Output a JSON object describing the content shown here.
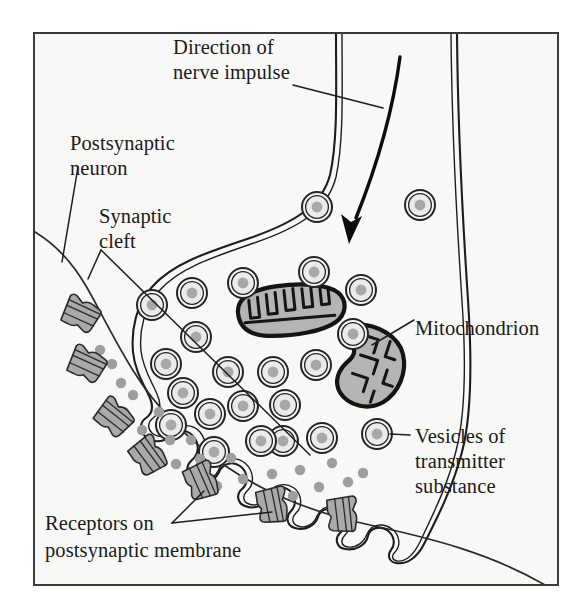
{
  "figure": {
    "background_color": "#ffffff",
    "panel_color": "#f8f8f6",
    "border_color": "#3a3a3a",
    "ink_color": "#1a1a1a",
    "organelle_fill": "#b4b4b4",
    "vesicle_core_color": "#a8a8a8",
    "transmitter_color": "#9e9e9e",
    "receptor_color": "#a9a9a9"
  },
  "labels": {
    "direction_line1": "Direction of",
    "direction_line2": "nerve impulse",
    "postsynaptic_line1": "Postsynaptic",
    "postsynaptic_line2": "neuron",
    "cleft_line1": "Synaptic",
    "cleft_line2": "cleft",
    "mitochondrion": "Mitochondrion",
    "vesicles_line1": "Vesicles of",
    "vesicles_line2": "transmitter",
    "vesicles_line3": "substance",
    "receptors_line1": "Receptors on",
    "receptors_line2": "postsynaptic membrane"
  },
  "structures": {
    "presynaptic_terminal": "presynaptic axon terminal",
    "postsynaptic_neuron": "postsynaptic neuron membrane",
    "synaptic_cleft": "synaptic cleft",
    "impulse_arrow": "direction of nerve impulse arrow",
    "mitochondria_count": 2,
    "vesicle_count": 26,
    "receptor_count": 8,
    "transmitter_dot_count": 30
  },
  "graphics": {
    "vesicles": [
      {
        "cx": 317,
        "cy": 207,
        "r": 15
      },
      {
        "cx": 420,
        "cy": 205,
        "r": 15
      },
      {
        "cx": 314,
        "cy": 272,
        "r": 15
      },
      {
        "cx": 361,
        "cy": 290,
        "r": 15
      },
      {
        "cx": 243,
        "cy": 283,
        "r": 15
      },
      {
        "cx": 192,
        "cy": 293,
        "r": 15
      },
      {
        "cx": 152,
        "cy": 305,
        "r": 15
      },
      {
        "cx": 196,
        "cy": 337,
        "r": 15
      },
      {
        "cx": 166,
        "cy": 364,
        "r": 15
      },
      {
        "cx": 228,
        "cy": 372,
        "r": 15
      },
      {
        "cx": 273,
        "cy": 372,
        "r": 15
      },
      {
        "cx": 316,
        "cy": 365,
        "r": 15
      },
      {
        "cx": 183,
        "cy": 393,
        "r": 15
      },
      {
        "cx": 210,
        "cy": 414,
        "r": 15
      },
      {
        "cx": 243,
        "cy": 406,
        "r": 15
      },
      {
        "cx": 285,
        "cy": 405,
        "r": 15
      },
      {
        "cx": 283,
        "cy": 441,
        "r": 15
      },
      {
        "cx": 322,
        "cy": 438,
        "r": 15
      },
      {
        "cx": 377,
        "cy": 434,
        "r": 15
      }
    ],
    "transmitter_dots": [
      {
        "cx": 97,
        "cy": 348
      },
      {
        "cx": 118,
        "cy": 380
      },
      {
        "cx": 121,
        "cy": 410
      },
      {
        "cx": 139,
        "cy": 428
      },
      {
        "cx": 166,
        "cy": 439
      },
      {
        "cx": 145,
        "cy": 459
      },
      {
        "cx": 172,
        "cy": 462
      },
      {
        "cx": 196,
        "cy": 458
      },
      {
        "cx": 228,
        "cy": 457
      },
      {
        "cx": 240,
        "cy": 477
      },
      {
        "cx": 269,
        "cy": 473
      },
      {
        "cx": 214,
        "cy": 484
      },
      {
        "cx": 297,
        "cy": 468
      },
      {
        "cx": 316,
        "cy": 485
      },
      {
        "cx": 345,
        "cy": 480
      },
      {
        "cx": 360,
        "cy": 471
      },
      {
        "cx": 188,
        "cy": 438
      }
    ]
  }
}
